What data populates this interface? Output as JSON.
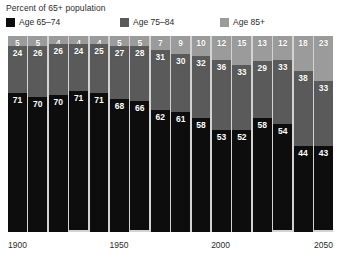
{
  "chart_data": {
    "type": "bar",
    "title": "Percent of 65+ population",
    "subtitle": "",
    "xlabel": "",
    "ylabel": "",
    "ylim": [
      0,
      100
    ],
    "grid": false,
    "stacked": true,
    "stack_order_bottom_to_top": [
      "Age 65–74",
      "Age 75–84",
      "Age 85+"
    ],
    "legend_position": "top",
    "categories": [
      "1900",
      "1910",
      "1920",
      "1930",
      "1940",
      "1950",
      "1960",
      "1970",
      "1980",
      "1990",
      "2000",
      "2010",
      "2020",
      "2030",
      "2040",
      "2050"
    ],
    "tick_labels": [
      "1900",
      "1950",
      "2000",
      "2050"
    ],
    "tick_positions": [
      0,
      5,
      10,
      15
    ],
    "series": [
      {
        "name": "Age 65–74",
        "color": "#0d0d0d",
        "values": [
          71,
          70,
          70,
          71,
          71,
          68,
          66,
          62,
          61,
          58,
          53,
          52,
          58,
          54,
          44,
          43
        ]
      },
      {
        "name": "Age 75–84",
        "color": "#5a5a5a",
        "values": [
          24,
          26,
          26,
          24,
          25,
          27,
          28,
          31,
          30,
          32,
          36,
          33,
          29,
          33,
          38,
          33
        ]
      },
      {
        "name": "Age 85+",
        "color": "#9b9b9b",
        "values": [
          5,
          5,
          4,
          4,
          4,
          5,
          5,
          7,
          9,
          10,
          12,
          15,
          13,
          12,
          18,
          23
        ]
      }
    ]
  },
  "legend": {
    "items": [
      {
        "label": "Age 65–74",
        "color": "#0d0d0d",
        "icon": "legend-swatch-icon"
      },
      {
        "label": "Age 75–84",
        "color": "#5a5a5a",
        "icon": "legend-swatch-icon"
      },
      {
        "label": "Age 85+",
        "color": "#9b9b9b",
        "icon": "legend-swatch-icon"
      }
    ]
  },
  "colors": {
    "plot_background": "#d3d3d3",
    "page_background": "#ffffff",
    "text": "#2b2b2b",
    "value_label": "#ffffff"
  }
}
